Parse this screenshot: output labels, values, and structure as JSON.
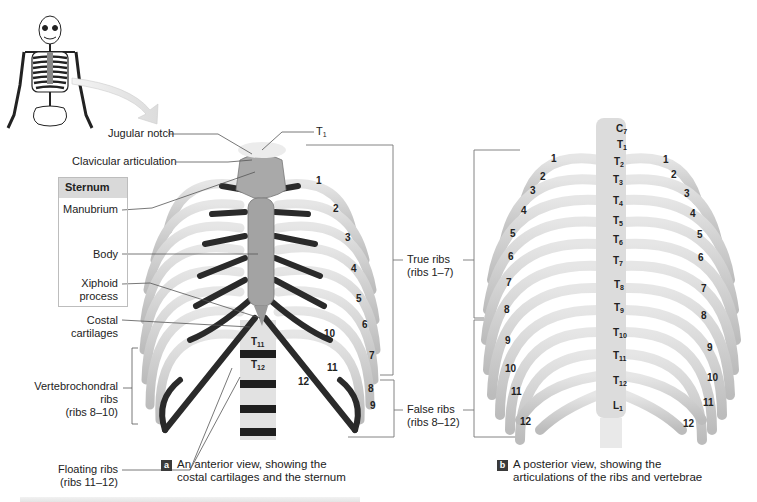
{
  "figure": {
    "panel_a": {
      "badge": "a",
      "caption_line1": "An anterior view, showing the",
      "caption_line2": "costal cartilages and the sternum",
      "labels": {
        "jugular_notch": "Jugular notch",
        "clavicular_articulation": "Clavicular articulation",
        "t1": "T",
        "t1_sub": "1",
        "costal_line1": "Costal",
        "costal_line2": "cartilages",
        "vertebrochondral_line1": "Vertebrochondral",
        "vertebrochondral_line2": "ribs",
        "vertebrochondral_line3": "(ribs 8–10)",
        "floating_line1": "Floating ribs",
        "floating_line2": "(ribs 11–12)"
      },
      "sternum_box": {
        "title": "Sternum",
        "manubrium": "Manubrium",
        "body": "Body",
        "xiphoid_line1": "Xiphoid",
        "xiphoid_line2": "process"
      },
      "rib_numbers": [
        "1",
        "2",
        "3",
        "4",
        "5",
        "6",
        "7",
        "8",
        "9",
        "10",
        "11",
        "12"
      ],
      "vertebrae": [
        {
          "letter": "T",
          "sub": "11"
        },
        {
          "letter": "T",
          "sub": "12"
        }
      ]
    },
    "center_labels": {
      "true_ribs_line1": "True ribs",
      "true_ribs_line2": "(ribs 1–7)",
      "false_ribs_line1": "False ribs",
      "false_ribs_line2": "(ribs 8–12)"
    },
    "panel_b": {
      "badge": "b",
      "caption_line1": "A posterior view, showing the",
      "caption_line2": "articulations of the ribs and vertebrae",
      "rib_numbers_left": [
        "1",
        "2",
        "3",
        "4",
        "5",
        "6",
        "7",
        "8",
        "9",
        "10",
        "11",
        "12"
      ],
      "rib_numbers_right": [
        "1",
        "2",
        "3",
        "4",
        "5",
        "6",
        "7",
        "8",
        "9",
        "10",
        "11",
        "12"
      ],
      "vertebrae": [
        {
          "letter": "C",
          "sub": "7"
        },
        {
          "letter": "T",
          "sub": "1"
        },
        {
          "letter": "T",
          "sub": "2"
        },
        {
          "letter": "T",
          "sub": "3"
        },
        {
          "letter": "T",
          "sub": "4"
        },
        {
          "letter": "T",
          "sub": "5"
        },
        {
          "letter": "T",
          "sub": "6"
        },
        {
          "letter": "T",
          "sub": "7"
        },
        {
          "letter": "T",
          "sub": "8"
        },
        {
          "letter": "T",
          "sub": "9"
        },
        {
          "letter": "T",
          "sub": "10"
        },
        {
          "letter": "T",
          "sub": "11"
        },
        {
          "letter": "T",
          "sub": "12"
        },
        {
          "letter": "L",
          "sub": "1"
        }
      ]
    },
    "colors": {
      "bone": "#d6d6d6",
      "bone_shadow": "#a8a8a8",
      "cartilage": "#2b2b2b",
      "leader_line": "#555555",
      "bracket": "#777777",
      "sternum_header": "#d9d9d9",
      "badge": "#3a3a3a"
    }
  }
}
